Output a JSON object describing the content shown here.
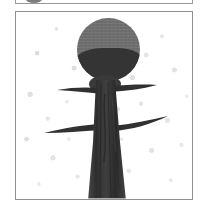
{
  "scene": {
    "title": "Tree with sun disc",
    "background_color": "#ffffff",
    "frame": {
      "border_color": "#8f8f8f",
      "border_width_px": 1,
      "x": 15,
      "y": 11,
      "width": 178,
      "height": 189
    }
  },
  "previous_frame_fragment": {
    "name": "cropped-image-above",
    "border_color": "#9a9a9a",
    "blob_color": "#7d7d7d"
  },
  "sun_disc": {
    "label": "sun-disc",
    "upper_color": "#6e6e6e",
    "lower_color": "#343434",
    "center_x": 92,
    "center_y": 37,
    "diameter_px": 63
  },
  "tree": {
    "label": "tree",
    "trunk_color": "#3a3a3a",
    "branch_color": "#30302f",
    "trunk_top_y": 70,
    "trunk_bottom_y": 189,
    "trunk_top_width_px": 20,
    "trunk_bottom_width_px": 34,
    "branches": [
      {
        "name": "upper-left-branch",
        "direction": "left",
        "y": 78,
        "length_px": 48
      },
      {
        "name": "upper-right-branch",
        "direction": "right",
        "y": 76,
        "length_px": 50
      },
      {
        "name": "lower-left-branch",
        "direction": "left",
        "y": 116,
        "length_px": 62
      },
      {
        "name": "lower-right-branch",
        "direction": "right",
        "y": 112,
        "length_px": 66
      }
    ]
  },
  "blossoms": {
    "label": "blossom-speckle-texture",
    "speckle_color": "#969696",
    "count": 28
  }
}
